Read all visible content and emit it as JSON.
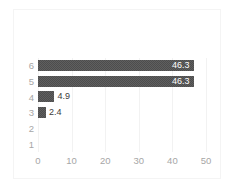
{
  "chart_data": {
    "type": "bar",
    "orientation": "horizontal",
    "title": "",
    "xlabel": "",
    "ylabel": "",
    "categories": [
      "6",
      "5",
      "4",
      "3",
      "2",
      "1"
    ],
    "values": [
      46.3,
      46.3,
      4.9,
      2.4,
      0,
      0
    ],
    "data_labels": [
      "46.3",
      "46.3",
      "4.9",
      "2.4",
      "",
      ""
    ],
    "xlim": [
      0,
      50
    ],
    "xticks": [
      0,
      10,
      20,
      30,
      40,
      50
    ],
    "xtick_labels": [
      "0",
      "10",
      "20",
      "30",
      "40",
      "50"
    ],
    "grid": "vertical",
    "legend": "none",
    "bar_color": "#4d4d4d",
    "label_color_inside": "#ffffff",
    "label_color_outside": "#3c3c3c",
    "axis_text_color": "#a6a6a6",
    "background_color": "#ffffff"
  }
}
